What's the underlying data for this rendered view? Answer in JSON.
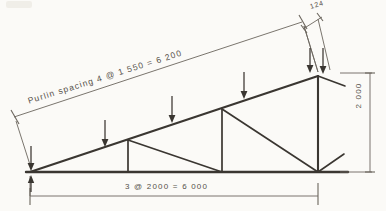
{
  "drawing": {
    "title": "Roof truss elevation - hand sketch",
    "paper_color": "#fbfaf7",
    "ink_color": "#3a3631",
    "dimension_ink_color": "#555049"
  },
  "labels": {
    "purlin_spacing": "Purlin  spacing   4  @   1 550   =   6 200",
    "span": "3  @   2000   =   6 000",
    "height": "2 000",
    "overhang": "124"
  },
  "geometry": {
    "left_support": {
      "x": 30,
      "y": 172
    },
    "right_node": {
      "x": 318,
      "y": 172
    },
    "apex": {
      "x": 318,
      "y": 76
    },
    "top_chord_nodes": [
      {
        "x": 30,
        "y": 172
      },
      {
        "x": 105,
        "y": 148
      },
      {
        "x": 174,
        "y": 123
      },
      {
        "x": 246,
        "y": 99
      },
      {
        "x": 318,
        "y": 76
      }
    ],
    "bottom_chord_nodes": [
      {
        "x": 30,
        "y": 172
      },
      {
        "x": 128,
        "y": 172
      },
      {
        "x": 222,
        "y": 172
      },
      {
        "x": 318,
        "y": 172
      }
    ],
    "verticals": [
      {
        "x": 128,
        "y_top": 140,
        "y_bottom": 172
      },
      {
        "x": 222,
        "y_top": 109,
        "y_bottom": 172
      },
      {
        "x": 318,
        "y_top": 76,
        "y_bottom": 172
      }
    ],
    "diagonals": [
      {
        "x1": 128,
        "y1": 140,
        "x2": 222,
        "y2": 172
      },
      {
        "x1": 222,
        "y1": 109,
        "x2": 318,
        "y2": 172
      }
    ],
    "overhang_stub_apex": {
      "x1": 318,
      "y1": 76,
      "x2": 345,
      "y2": 86
    },
    "stub_bottom_right": {
      "x1": 318,
      "y1": 172,
      "x2": 344,
      "y2": 154
    }
  },
  "loads": {
    "arrow_color": "#3a3631",
    "arrows": [
      {
        "name": "load-arrow-1",
        "x": 31,
        "y_top": 146,
        "y_tip": 170
      },
      {
        "name": "load-arrow-2",
        "x": 105,
        "y_top": 120,
        "y_tip": 146
      },
      {
        "name": "load-arrow-3",
        "x": 172,
        "y_top": 96,
        "y_tip": 122
      },
      {
        "name": "load-arrow-4",
        "x": 244,
        "y_top": 72,
        "y_tip": 98
      },
      {
        "name": "load-arrow-5",
        "x": 310,
        "y_top": 48,
        "y_tip": 72
      },
      {
        "name": "load-arrow-6",
        "x": 323,
        "y_top": 48,
        "y_tip": 73
      }
    ]
  },
  "dimension_lines": {
    "purlin": {
      "x1": 14,
      "y1": 117,
      "x2": 302,
      "y2": 22
    },
    "span": {
      "x1": 30,
      "y1": 196,
      "x2": 318,
      "y2": 196
    },
    "height": {
      "x": 370,
      "y1": 73,
      "y2": 172
    },
    "overhang": {
      "x1": 305,
      "y1": 27,
      "x2": 320,
      "y2": 17
    }
  }
}
